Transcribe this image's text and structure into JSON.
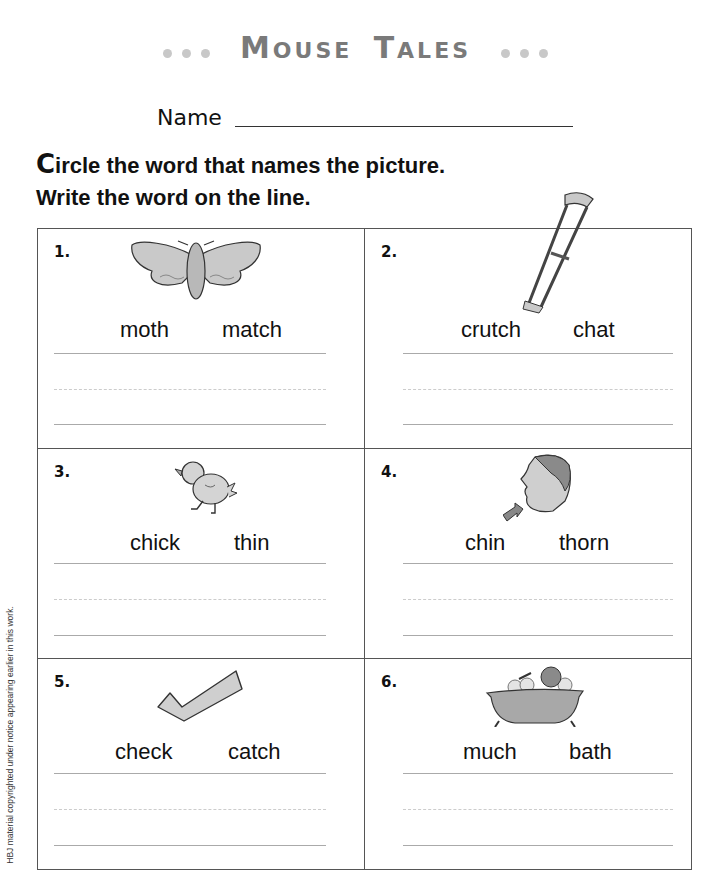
{
  "header": {
    "title_first_cap": "M",
    "title_first_rest": "OUSE",
    "title_second_cap": "T",
    "title_second_rest": "ALES",
    "decoration": "dot-separators"
  },
  "name_field": {
    "label": "Name",
    "value": ""
  },
  "instructions": {
    "line1_cap": "C",
    "line1_rest": "ircle the word that names the picture.",
    "line2": "Write the word on the line."
  },
  "items": [
    {
      "number": "1.",
      "picture": "moth-icon",
      "choice_a": "moth",
      "choice_b": "match",
      "answer": ""
    },
    {
      "number": "2.",
      "picture": "crutch-icon",
      "choice_a": "crutch",
      "choice_b": "chat",
      "answer": ""
    },
    {
      "number": "3.",
      "picture": "chick-icon",
      "choice_a": "chick",
      "choice_b": "thin",
      "answer": ""
    },
    {
      "number": "4.",
      "picture": "chin-icon",
      "choice_a": "chin",
      "choice_b": "thorn",
      "answer": ""
    },
    {
      "number": "5.",
      "picture": "check-mark-icon",
      "choice_a": "check",
      "choice_b": "catch",
      "answer": ""
    },
    {
      "number": "6.",
      "picture": "bath-icon",
      "choice_a": "much",
      "choice_b": "bath",
      "answer": ""
    }
  ],
  "copyright": "HBJ material copyrighted under notice appearing earlier in this work.",
  "colors": {
    "title_gray": "#7a7a7a",
    "dot_gray": "#c8c8c8",
    "grid_border": "#555555",
    "writing_line": "#aaaaaa"
  }
}
